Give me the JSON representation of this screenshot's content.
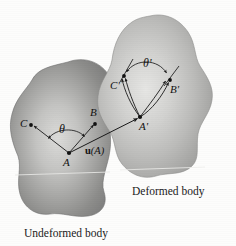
{
  "figure": {
    "background_color": "#fdfdfc",
    "line_color": "#1a1a1a",
    "undeformed_fill": "#9a9a99",
    "deformed_fill": "#b9b9b7"
  },
  "captions": {
    "undeformed": "Undeformed body",
    "deformed": "Deformed body"
  },
  "points": {
    "A": {
      "label": "A",
      "x": 69,
      "y": 153
    },
    "B": {
      "label": "B",
      "x": 95,
      "y": 124
    },
    "C": {
      "label": "C",
      "x": 31,
      "y": 125
    },
    "A_prime": {
      "label": "A'",
      "x": 140,
      "y": 117
    },
    "B_prime": {
      "label": "B'",
      "x": 170,
      "y": 80
    },
    "C_prime": {
      "label": "C'",
      "x": 124,
      "y": 76
    }
  },
  "angles": {
    "theta": {
      "label": "θ",
      "x": 62,
      "y": 128
    },
    "theta_prime": {
      "label": "θ'",
      "x": 146,
      "y": 63
    }
  },
  "vector": {
    "symbol": "u",
    "argument": "(A)",
    "from": "A",
    "to": "A'",
    "label_x": 85,
    "label_y": 146
  }
}
